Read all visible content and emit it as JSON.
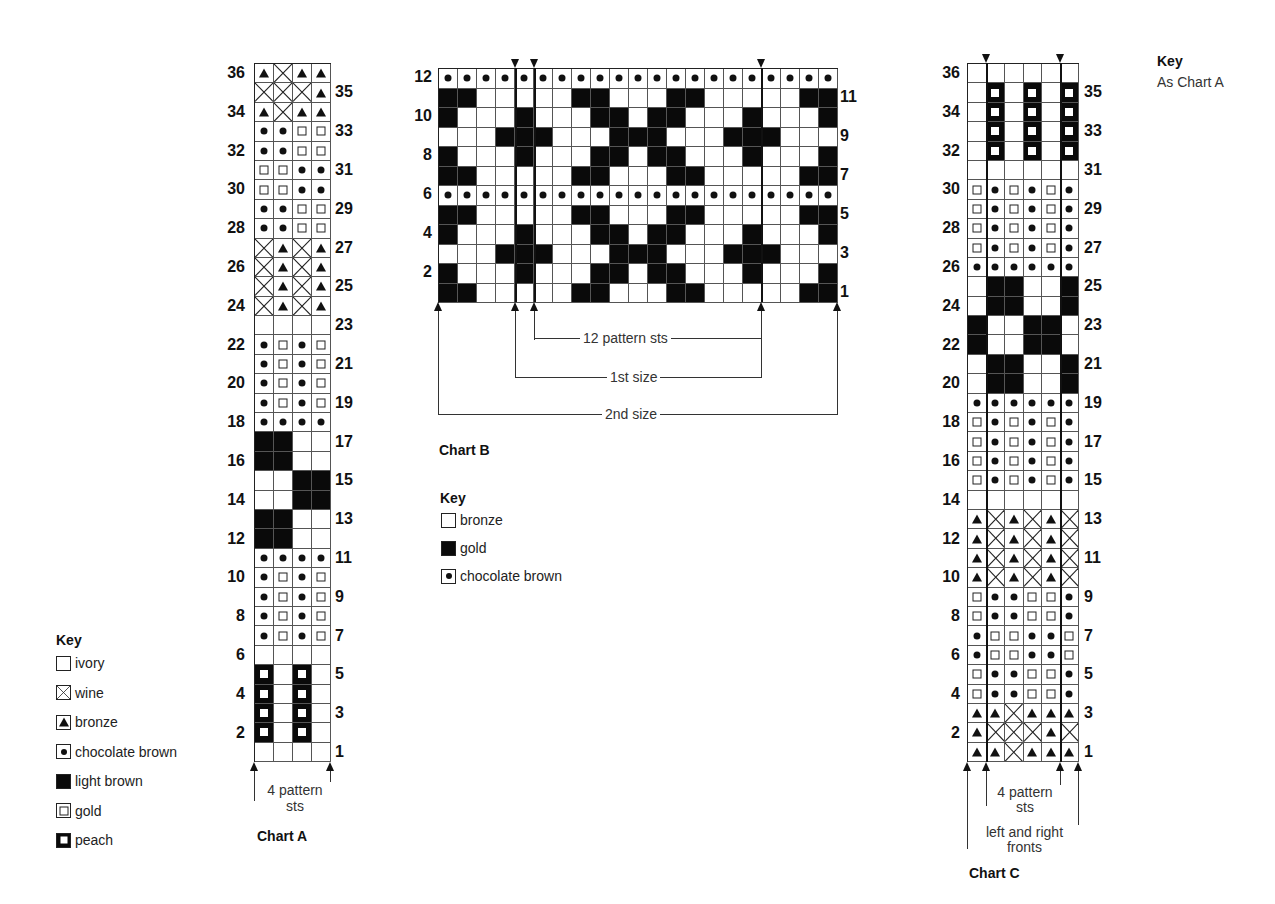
{
  "legend_codes": {
    ".": "empty",
    "X": "wine (cross)",
    "T": "bronze (triangle)",
    "D": "chocolate brown (dot)",
    "L": "solid dark",
    "G": "gold (small square)",
    "P": "peach (bold square)"
  },
  "chart_data": [
    {
      "type": "table",
      "title": "Chart A",
      "columns": 4,
      "rows_top_to_bottom": [
        "TXTT",
        "XXXT",
        "TXTT",
        "DDGG",
        "DDGG",
        "GGDD",
        "GGDD",
        "DDGG",
        "DDGG",
        "XTXT",
        "XTXT",
        "XTXT",
        "XTXT",
        "....",
        "DGDG",
        "DGDG",
        "DGDG",
        "DGDG",
        "DDDD",
        "LL..",
        "LL..",
        "..LL",
        "..LL",
        "LL..",
        "LL..",
        "DDDD",
        "DGDG",
        "DGDG",
        "DGDG",
        "DGDG",
        "....",
        "P.P.",
        "P.P.",
        "P.P.",
        "P.P.",
        "...."
      ],
      "row_labels_left": [
        "36",
        "34",
        "32",
        "30",
        "28",
        "26",
        "24",
        "22",
        "20",
        "18",
        "16",
        "14",
        "12",
        "10",
        "8",
        "6",
        "4",
        "2"
      ],
      "row_labels_right": [
        "35",
        "33",
        "31",
        "29",
        "27",
        "25",
        "23",
        "21",
        "19",
        "17",
        "15",
        "13",
        "11",
        "9",
        "7",
        "5",
        "3",
        "1"
      ],
      "annotation": "4 pattern sts"
    },
    {
      "type": "table",
      "title": "Chart B",
      "columns": 21,
      "rows_top_to_bottom": [
        "DDDDDDDDDDDDDDDDDDDDD",
        "LL.....LL...LL.....LL",
        "L...L...LL.LL...L...L",
        "...LLL...LLL...LLL...",
        "L...L...LL.LL...L...L",
        "LL.....LL...LL.....LL",
        "DDDDDDDDDDDDDDDDDDDDD",
        "LL.....LL...LL.....LL",
        "L...L...LL.LL...L...L",
        "...LLL...LLL...LLL...",
        "L...L...LL.LL...L...L",
        "LL.....LL...LL.....LL"
      ],
      "row_labels_left": [
        "12",
        "10",
        "8",
        "6",
        "4",
        "2"
      ],
      "row_labels_right": [
        "11",
        "9",
        "7",
        "5",
        "3",
        "1"
      ],
      "annotations": [
        "12 pattern sts",
        "1st size",
        "2nd size"
      ]
    },
    {
      "type": "table",
      "title": "Chart C",
      "columns": 6,
      "rows_top_to_bottom": [
        "......",
        ".P.P.P",
        ".P.P.P",
        ".P.P.P",
        ".P.P.P",
        "......",
        "GDGDGD",
        "GDGDGD",
        "GDGDGD",
        "GDGDGD",
        "DDDDDD",
        ".LL..L",
        ".LL..L",
        "L..LL.",
        "L..LL.",
        ".LL..L",
        ".LL..L",
        "DDDDDD",
        "GDGDGD",
        "GDGDGD",
        "GDGDGD",
        "GDGDGD",
        "......",
        "TXTXTX",
        "TXTXTX",
        "TXTXTX",
        "TXTXTX",
        "GDDGGD",
        "GDDGGD",
        "DGGDDG",
        "DGGDDG",
        "GDDGGD",
        "GDDGGD",
        "TTXTTT",
        "TXXXTX",
        "TTXTTT"
      ],
      "row_labels_left": [
        "36",
        "34",
        "32",
        "30",
        "28",
        "26",
        "24",
        "22",
        "20",
        "18",
        "16",
        "14",
        "12",
        "10",
        "8",
        "6",
        "4",
        "2"
      ],
      "row_labels_right": [
        "35",
        "33",
        "31",
        "29",
        "27",
        "25",
        "23",
        "21",
        "19",
        "17",
        "15",
        "13",
        "11",
        "9",
        "7",
        "5",
        "3",
        "1"
      ],
      "annotations": [
        "4 pattern sts",
        "left and right fronts"
      ]
    }
  ],
  "charts": {
    "a": {
      "title": "Chart A",
      "pattern_label": "4 pattern\nsts"
    },
    "b": {
      "title": "Chart B",
      "pattern_label": "12 pattern sts",
      "size1_label": "1st size",
      "size2_label": "2nd size"
    },
    "c": {
      "title": "Chart C",
      "pattern_label": "4 pattern\nsts",
      "fronts_label": "left and right\nfronts"
    }
  },
  "key_a": {
    "title": "Key",
    "items": [
      {
        "code": ".",
        "label": "ivory"
      },
      {
        "code": "X",
        "label": "wine"
      },
      {
        "code": "T",
        "label": "bronze"
      },
      {
        "code": "D",
        "label": "chocolate brown"
      },
      {
        "code": "L",
        "label": "light brown"
      },
      {
        "code": "G",
        "label": "gold"
      },
      {
        "code": "P",
        "label": "peach"
      }
    ]
  },
  "key_b": {
    "title": "Key",
    "items": [
      {
        "code": ".",
        "label": "bronze"
      },
      {
        "code": "L",
        "label": "gold"
      },
      {
        "code": "D",
        "label": "chocolate brown"
      }
    ]
  },
  "key_c": {
    "title": "Key",
    "note": "As Chart A"
  }
}
